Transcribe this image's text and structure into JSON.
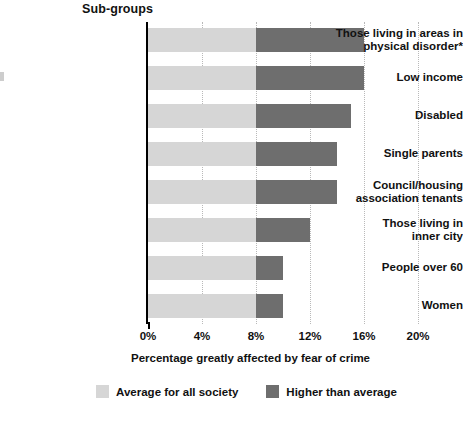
{
  "title": "Sub-groups",
  "axis_title": "Percentage greatly affected by fear of crime",
  "legend": [
    {
      "label": "Average for all society",
      "color": "#d6d6d6",
      "swatch_name": "legend-swatch-average"
    },
    {
      "label": "Higher than average",
      "color": "#6e6e6e",
      "swatch_name": "legend-swatch-higher"
    }
  ],
  "ticks": [
    {
      "label": "0%",
      "value": 0
    },
    {
      "label": "4%",
      "value": 4
    },
    {
      "label": "8%",
      "value": 8
    },
    {
      "label": "12%",
      "value": 12
    },
    {
      "label": "16%",
      "value": 16
    },
    {
      "label": "20%",
      "value": 20
    }
  ],
  "chart_data": {
    "type": "bar",
    "orientation": "horizontal",
    "stacked": true,
    "title": "Sub-groups",
    "xlabel": "Percentage greatly affected by fear of crime",
    "ylabel": "",
    "xlim": [
      0,
      20
    ],
    "xticks": [
      0,
      4,
      8,
      12,
      16,
      20
    ],
    "xtick_labels": [
      "0%",
      "4%",
      "8%",
      "12%",
      "16%",
      "20%"
    ],
    "grid": "vertical-dotted",
    "legend_position": "bottom-center",
    "baseline_value": 8,
    "categories": [
      "Those living in areas in physical disorder*",
      "Low income",
      "Disabled",
      "Single parents",
      "Council/housing association tenants",
      "Those living in inner city",
      "People over 60",
      "Women"
    ],
    "category_lines": [
      [
        "Those living in areas in",
        "physical disorder*"
      ],
      [
        "Low income"
      ],
      [
        "Disabled"
      ],
      [
        "Single parents"
      ],
      [
        "Council/housing",
        "association tenants"
      ],
      [
        "Those living in",
        "inner city"
      ],
      [
        "People over 60"
      ],
      [
        "Women"
      ]
    ],
    "series": [
      {
        "name": "Average for all society",
        "color": "#d6d6d6",
        "values": [
          8,
          8,
          8,
          8,
          8,
          8,
          8,
          8
        ]
      },
      {
        "name": "Higher than average",
        "color": "#6e6e6e",
        "values": [
          8,
          8,
          7,
          6,
          6,
          4,
          2,
          2
        ]
      }
    ],
    "totals": [
      16,
      16,
      15,
      14,
      14,
      12,
      10,
      10
    ]
  }
}
